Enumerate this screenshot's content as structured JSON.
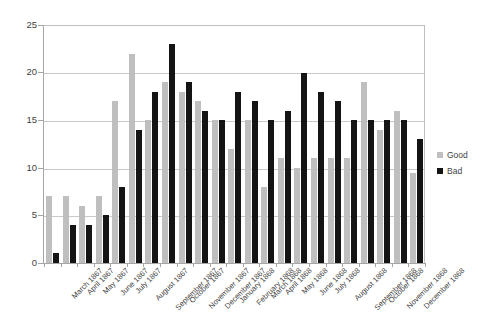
{
  "chart_data": {
    "type": "bar",
    "title": "",
    "subtitle": "",
    "xlabel": "",
    "ylabel": "",
    "ylim": [
      0,
      25
    ],
    "yticks": [
      0,
      5,
      10,
      15,
      20,
      25
    ],
    "grid": true,
    "legend_position": "right",
    "categories": [
      "March 1867",
      "April 1867",
      "May 1867",
      "June 1867",
      "July 1867",
      "August 1867",
      "September 1867",
      "October 1867",
      "November 1867",
      "December 1867",
      "January 1868",
      "February 1868",
      "March 1868",
      "April 1868",
      "May 1868",
      "June 1868",
      "July 1868",
      "August 1868",
      "September 1868",
      "October 1868",
      "November 1868",
      "December 1868"
    ],
    "series": [
      {
        "name": "Good",
        "color": "#bfbfbf",
        "values": [
          7,
          7,
          6,
          7,
          17,
          22,
          15,
          19,
          18,
          17,
          15,
          12,
          15,
          8,
          11,
          10,
          11,
          11,
          11,
          19,
          14,
          16
        ]
      },
      {
        "name": "Bad",
        "color": "#141414",
        "values": [
          1,
          4,
          4,
          5,
          8,
          14,
          18,
          23,
          19,
          16,
          15,
          18,
          17,
          15,
          16,
          20,
          18,
          17,
          15,
          15,
          15,
          15
        ]
      }
    ],
    "extra_group": {
      "label": "",
      "good": 9.5,
      "bad": 13
    }
  },
  "legend": {
    "items": [
      {
        "label": "Good"
      },
      {
        "label": "Bad"
      }
    ]
  },
  "axis": {
    "y_tick_labels": [
      "25",
      "20",
      "15",
      "10",
      "5",
      "0"
    ]
  }
}
